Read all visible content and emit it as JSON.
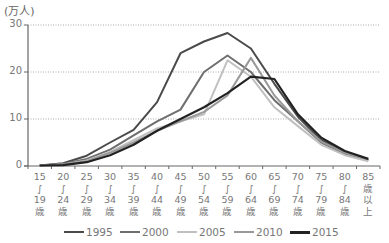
{
  "chart_data": {
    "type": "line",
    "title": "",
    "unit_label": "(万人)",
    "xlabel": "",
    "ylabel": "(万人)",
    "ylim": [
      0,
      30
    ],
    "yticks": [
      0,
      10,
      20,
      30
    ],
    "grid": "horizontal dotted at 10, 20, 30",
    "legend_position": "bottom",
    "categories": [
      "15~19歳",
      "20~24歳",
      "25~29歳",
      "30~34歳",
      "35~39歳",
      "40~44歳",
      "45~49歳",
      "50~54歳",
      "55~59歳",
      "60~64歳",
      "65~69歳",
      "70~74歳",
      "75~79歳",
      "80~84歳",
      "85歳以上"
    ],
    "category_labels": [
      [
        "15",
        "∫",
        "19",
        "歳"
      ],
      [
        "20",
        "∫",
        "24",
        "歳"
      ],
      [
        "25",
        "∫",
        "29",
        "歳"
      ],
      [
        "30",
        "∫",
        "34",
        "歳"
      ],
      [
        "35",
        "∫",
        "39",
        "歳"
      ],
      [
        "40",
        "∫",
        "44",
        "歳"
      ],
      [
        "45",
        "∫",
        "49",
        "歳"
      ],
      [
        "50",
        "∫",
        "54",
        "歳"
      ],
      [
        "55",
        "∫",
        "59",
        "歳"
      ],
      [
        "60",
        "∫",
        "64",
        "歳"
      ],
      [
        "65",
        "∫",
        "69",
        "歳"
      ],
      [
        "70",
        "∫",
        "74",
        "歳"
      ],
      [
        "75",
        "∫",
        "79",
        "歳"
      ],
      [
        "80",
        "∫",
        "84",
        "歳"
      ],
      [
        "85",
        "歳",
        "以",
        "上"
      ]
    ],
    "series": [
      {
        "name": "1995",
        "color": "#4a4a4a",
        "width": 2,
        "values": [
          0.1,
          0.6,
          2.2,
          5.0,
          7.7,
          13.6,
          24.0,
          26.5,
          28.3,
          25.0,
          17.5,
          10.5,
          5.5,
          3.0,
          1.3
        ]
      },
      {
        "name": "2000",
        "color": "#6e6e6e",
        "width": 2,
        "values": [
          0.1,
          0.4,
          1.5,
          3.5,
          6.5,
          9.5,
          12.0,
          20.0,
          23.5,
          20.0,
          14.0,
          9.5,
          5.0,
          2.6,
          1.2
        ]
      },
      {
        "name": "2005",
        "color": "#c0c0c0",
        "width": 2,
        "values": [
          0.1,
          0.3,
          1.2,
          3.0,
          5.5,
          8.0,
          9.5,
          11.0,
          22.5,
          19.0,
          12.5,
          8.5,
          4.5,
          2.3,
          1.0
        ]
      },
      {
        "name": "2010",
        "color": "#999999",
        "width": 2,
        "values": [
          0.1,
          0.3,
          1.0,
          2.8,
          5.0,
          7.5,
          9.5,
          11.5,
          15.0,
          23.0,
          15.0,
          9.5,
          5.2,
          2.8,
          1.4
        ]
      },
      {
        "name": "2015",
        "color": "#222222",
        "width": 2.2,
        "values": [
          0.1,
          0.2,
          0.8,
          2.3,
          4.5,
          7.5,
          10.0,
          12.5,
          15.5,
          19.0,
          18.5,
          11.0,
          6.0,
          3.2,
          1.5
        ]
      }
    ]
  }
}
